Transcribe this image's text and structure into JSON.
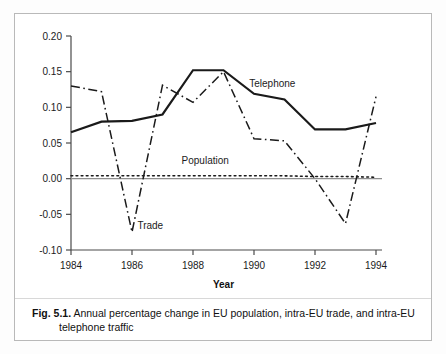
{
  "figure": {
    "caption_number": "Fig. 5.1.",
    "caption_line1": "Annual percentage change in EU population, intra-EU trade, and intra-EU",
    "caption_line2": "telephone traffic"
  },
  "chart_data": {
    "type": "line",
    "title": "",
    "xlabel": "Year",
    "ylabel": "",
    "xlim": [
      1984,
      1994
    ],
    "ylim": [
      -0.1,
      0.2
    ],
    "grid": false,
    "legend": "inline-annotations",
    "xticks": [
      "1984",
      "1986",
      "1988",
      "1990",
      "1992",
      "1994"
    ],
    "xtick_values": [
      1984,
      1986,
      1988,
      1990,
      1992,
      1994
    ],
    "yticks": [
      "0.20",
      "0.15",
      "0.10",
      "0.05",
      "0.00",
      "-0.05",
      "-0.10"
    ],
    "ytick_values": [
      0.2,
      0.15,
      0.1,
      0.05,
      0.0,
      -0.05,
      -0.1
    ],
    "x": [
      1984,
      1985,
      1986,
      1987,
      1988,
      1989,
      1990,
      1991,
      1992,
      1993,
      1994
    ],
    "series": [
      {
        "name": "Telephone",
        "style": "solid",
        "color": "#1a1a1a",
        "width": 2.2,
        "values": [
          0.065,
          0.08,
          0.081,
          0.09,
          0.152,
          0.152,
          0.119,
          0.111,
          0.069,
          0.069,
          0.078
        ],
        "label": "Telephone",
        "label_x": 1990.6,
        "label_y": 0.128
      },
      {
        "name": "Trade",
        "style": "dash-dot",
        "color": "#1a1a1a",
        "width": 1.5,
        "values": [
          0.13,
          0.122,
          -0.075,
          0.131,
          0.107,
          0.15,
          0.056,
          0.053,
          0.0,
          -0.063,
          0.115
        ],
        "label": "Trade",
        "label_x": 1986.6,
        "label_y": -0.07
      },
      {
        "name": "Population",
        "style": "dotted",
        "color": "#1a1a1a",
        "width": 1.6,
        "values": [
          0.004,
          0.004,
          0.004,
          0.004,
          0.004,
          0.004,
          0.004,
          0.004,
          0.003,
          0.003,
          0.002
        ],
        "label": "Population",
        "label_x": 1988.4,
        "label_y": 0.02
      }
    ],
    "zero_line": 0.0
  }
}
